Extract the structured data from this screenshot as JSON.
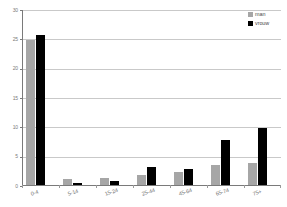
{
  "chart_data": {
    "type": "bar",
    "title": "",
    "subtitle": "",
    "xlabel": "",
    "ylabel": "",
    "categories": [
      "0-4",
      "5-14",
      "15-24",
      "25-44",
      "45-64",
      "65-74",
      "75+"
    ],
    "series": [
      {
        "name": "man",
        "color": "#a6a6a6",
        "values": [
          24.8,
          1.1,
          1.2,
          1.7,
          2.2,
          3.4,
          3.7
        ]
      },
      {
        "name": "vrouw",
        "color": "#000000",
        "values": [
          25.6,
          0.4,
          0.6,
          3.1,
          2.7,
          7.6,
          9.7
        ]
      }
    ],
    "ylim": [
      0,
      30
    ],
    "yticks": [
      0,
      5,
      10,
      15,
      20,
      25,
      30
    ],
    "ytick_labels": [
      "0",
      "5",
      "10",
      "15",
      "20",
      "25",
      "30"
    ],
    "grid": true,
    "legend_position": "top-right",
    "background_color": "#ffffff",
    "gridline_color": "#c9c9c9",
    "axis_color": "#7a7a7a",
    "tick_label_color": "#7b7b7b"
  }
}
